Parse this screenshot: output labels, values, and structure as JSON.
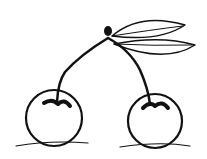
{
  "image": {
    "subject": "cherries line drawing",
    "colors": {
      "ink": "#111111",
      "background": "#ffffff"
    },
    "elements": [
      "left-cherry",
      "right-cherry",
      "stems",
      "leaves"
    ]
  }
}
